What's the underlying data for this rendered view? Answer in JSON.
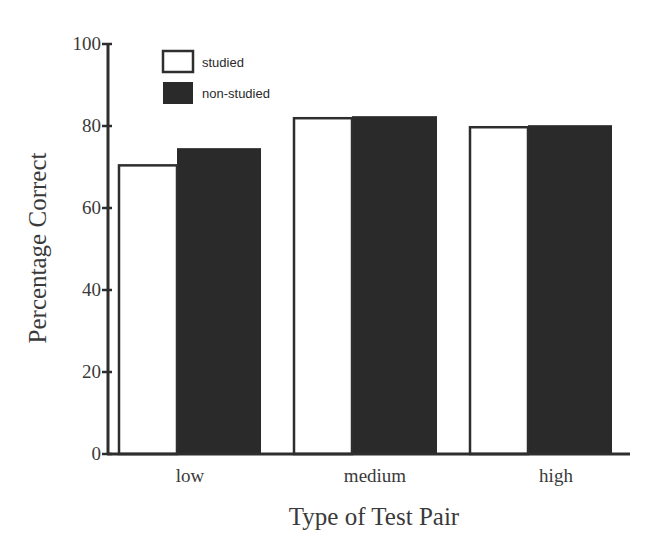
{
  "chart_data": {
    "type": "bar",
    "title": "",
    "xlabel": "Type of Test Pair",
    "ylabel": "Percentage Correct",
    "categories": [
      "low",
      "medium",
      "high"
    ],
    "series": [
      {
        "name": "studied",
        "values": [
          70.4,
          81.9,
          79.7
        ],
        "color": "#ffffff"
      },
      {
        "name": "non-studied",
        "values": [
          74.6,
          82.4,
          80.2
        ],
        "color": "#2b2b2b"
      }
    ],
    "ylim": [
      0,
      100
    ],
    "yticks": [
      0,
      20,
      40,
      60,
      80,
      100
    ],
    "grid": false,
    "legend_position": "top-left"
  },
  "legend": {
    "items": [
      {
        "label": "studied"
      },
      {
        "label": "non-studied"
      }
    ]
  },
  "axes": {
    "x_title": "Type of Test Pair",
    "y_title": "Percentage Correct",
    "y_ticks": [
      "0",
      "20",
      "40",
      "60",
      "80",
      "100"
    ],
    "x_ticks": [
      "low",
      "medium",
      "high"
    ]
  }
}
